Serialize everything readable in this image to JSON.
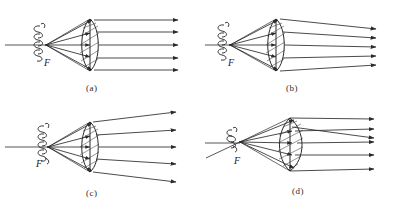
{
  "figure": {
    "panel_count": 4,
    "stroke_color": "#2a2a2a",
    "background_color": "#ffffff"
  },
  "panels": [
    {
      "id": "a",
      "caption": "(a)",
      "focus_label": "F",
      "source": "lamp-filament-coil",
      "lens": "biconvex-converging-lens",
      "ray_count": 5,
      "output_ray_behavior": "parallel",
      "description": "Filament at focal point F; rays emerge exactly parallel to the optical axis"
    },
    {
      "id": "b",
      "caption": "(b)",
      "focus_label": "F",
      "source": "lamp-filament-coil",
      "lens": "biconvex-converging-lens",
      "ray_count": 5,
      "output_ray_behavior": "converging",
      "description": "Rays emerge converging slightly toward the optical axis"
    },
    {
      "id": "c",
      "caption": "(c)",
      "focus_label": "F",
      "source": "lamp-filament-coil",
      "lens": "biconvex-converging-lens",
      "ray_count": 5,
      "output_ray_behavior": "diverging",
      "description": "Rays emerge diverging away from the optical axis"
    },
    {
      "id": "d",
      "caption": "(d)",
      "focus_label": "F",
      "source": "lamp-filament-coil",
      "lens": "biconvex-converging-lens",
      "ray_count": 5,
      "output_ray_behavior": "crossing",
      "description": "Rays cross each other after leaving the lens"
    }
  ]
}
